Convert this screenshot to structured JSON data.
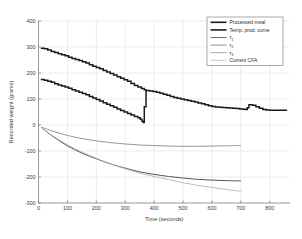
{
  "chart_data": {
    "type": "line",
    "title": "",
    "xlabel": "Time (seconds)",
    "ylabel": "Recorded weight (grams)",
    "xlim": [
      0,
      870
    ],
    "ylim": [
      -300,
      400
    ],
    "xticks": [
      0,
      100,
      200,
      300,
      400,
      500,
      600,
      700,
      800
    ],
    "yticks": [
      -300,
      -200,
      -100,
      0,
      100,
      200,
      300,
      400
    ],
    "grid": true,
    "legend_position": "top-right",
    "series": [
      {
        "name": "Processed meal",
        "color": "#1a1a1a",
        "width": 1.5,
        "style": "staircase",
        "x": [
          8,
          20,
          32,
          44,
          56,
          68,
          80,
          92,
          104,
          116,
          128,
          140,
          152,
          164,
          176,
          188,
          200,
          212,
          224,
          236,
          248,
          260,
          272,
          284,
          296,
          308,
          320,
          332,
          344,
          356,
          366,
          372,
          384,
          396,
          408,
          420,
          432,
          444,
          456,
          468,
          480,
          492,
          504,
          516,
          528,
          540,
          552,
          564,
          576,
          588,
          600,
          612,
          624,
          636,
          648,
          660,
          672,
          684,
          696,
          708,
          716,
          722,
          728,
          740,
          752,
          764,
          776,
          788,
          800,
          812,
          824,
          836,
          848,
          860
        ],
        "y": [
          295,
          293,
          288,
          283,
          279,
          274,
          270,
          266,
          261,
          256,
          252,
          248,
          243,
          238,
          232,
          226,
          221,
          216,
          210,
          204,
          198,
          192,
          186,
          180,
          174,
          168,
          160,
          152,
          146,
          140,
          136,
          133,
          131,
          129,
          126,
          122,
          118,
          114,
          110,
          106,
          103,
          100,
          97,
          94,
          91,
          88,
          85,
          82,
          78,
          74,
          71,
          69,
          68,
          67,
          66,
          65,
          64,
          63,
          62,
          61,
          60,
          66,
          78,
          76,
          70,
          64,
          60,
          58,
          57,
          57,
          57,
          57,
          57,
          57
        ],
        "note": "Upper staircase curve; merges with temp. prod. curve after t=370; bump near t=720"
      },
      {
        "name": "Temp. prod. curve",
        "color": "#1a1a1a",
        "width": 1.5,
        "style": "staircase",
        "x": [
          8,
          20,
          32,
          44,
          56,
          68,
          80,
          92,
          104,
          116,
          128,
          140,
          152,
          164,
          176,
          188,
          200,
          212,
          224,
          236,
          248,
          260,
          272,
          284,
          296,
          308,
          320,
          332,
          344,
          352,
          358,
          362,
          364,
          366,
          372
        ],
        "y": [
          175,
          172,
          168,
          164,
          159,
          154,
          150,
          146,
          141,
          136,
          131,
          126,
          121,
          116,
          110,
          104,
          98,
          92,
          86,
          80,
          74,
          68,
          62,
          56,
          50,
          44,
          38,
          33,
          28,
          22,
          14,
          11,
          10,
          70,
          133
        ],
        "note": "Lower staircase curve dropping to ~10 at t=360 then jumping to ~133"
      },
      {
        "name": "tau_1",
        "label": "τ₁",
        "color": "#8c8c8c",
        "width": 0.9,
        "style": "smooth",
        "x": [
          10,
          50,
          100,
          150,
          200,
          250,
          300,
          350,
          400,
          450,
          500,
          550,
          600,
          650,
          700
        ],
        "y": [
          -8,
          -24,
          -40,
          -52,
          -61,
          -68,
          -73,
          -77,
          -79,
          -81,
          -82,
          -82,
          -81,
          -80,
          -79
        ],
        "note": "Upper (shallowest) decaying curve, ends near -79"
      },
      {
        "name": "tau_2",
        "label": "τ₂",
        "color": "#555555",
        "width": 1.0,
        "style": "smooth",
        "x": [
          10,
          50,
          100,
          150,
          200,
          250,
          300,
          350,
          400,
          450,
          500,
          550,
          600,
          650,
          700
        ],
        "y": [
          -10,
          -44,
          -80,
          -108,
          -130,
          -150,
          -166,
          -180,
          -190,
          -198,
          -204,
          -209,
          -212,
          -214,
          -215
        ],
        "note": "Middle dark decaying curve, ends near -215"
      },
      {
        "name": "tau_3",
        "label": "τ₃",
        "color": "#b5b5b5",
        "width": 0.9,
        "style": "smooth",
        "x": [
          10,
          50,
          100,
          150,
          200,
          250,
          300,
          350,
          400,
          450,
          500,
          550,
          600,
          650,
          700
        ],
        "y": [
          -10,
          -42,
          -76,
          -104,
          -128,
          -150,
          -168,
          -185,
          -198,
          -210,
          -222,
          -232,
          -240,
          -248,
          -255
        ],
        "note": "Lightest curve crossing below tau_2 after t~470, ends near -255"
      },
      {
        "name": "Current CFA",
        "color": "#cfcfcf",
        "width": 0.9,
        "style": "none",
        "x": [],
        "y": [],
        "note": "Legend entry only; no visible separate trace"
      }
    ]
  },
  "legend": {
    "entries": [
      {
        "label": "Processed meal",
        "sub": "",
        "color": "#1a1a1a",
        "width": 1.6
      },
      {
        "label": "Temp. prod. curve",
        "sub": "",
        "color": "#1a1a1a",
        "width": 1.6
      },
      {
        "label": "τ",
        "sub": "1",
        "color": "#6f6f6f",
        "width": 1.0
      },
      {
        "label": "τ",
        "sub": "2",
        "color": "#8f8f8f",
        "width": 1.0
      },
      {
        "label": "τ",
        "sub": "3",
        "color": "#a8a8a8",
        "width": 1.0
      },
      {
        "label": "Current CFA",
        "sub": "",
        "color": "#c6c6c6",
        "width": 1.0
      }
    ]
  },
  "axes": {
    "x_title": "Time (seconds)",
    "y_title": "Recorded weight (grams)",
    "x_tick_labels": [
      "0",
      "100",
      "200",
      "300",
      "400",
      "500",
      "600",
      "700",
      "800"
    ],
    "y_tick_labels": [
      "400",
      "300",
      "200",
      "100",
      "0",
      "-100",
      "-200",
      "-300"
    ]
  }
}
